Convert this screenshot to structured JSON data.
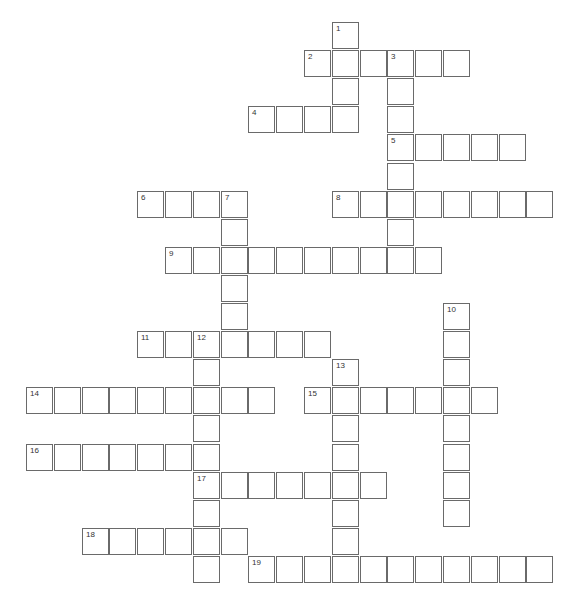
{
  "puzzle": {
    "type": "crossword",
    "grid": {
      "origin_x": 26,
      "origin_y": 22,
      "pitch_x": 27.8,
      "pitch_y": 28.1,
      "cell_size": 25
    },
    "entries": [
      {
        "number": "1",
        "direction": "down",
        "col": 11,
        "row": 0,
        "length": 4
      },
      {
        "number": "2",
        "direction": "across",
        "col": 10,
        "row": 1,
        "length": 6
      },
      {
        "number": "3",
        "direction": "down",
        "col": 13,
        "row": 1,
        "length": 8
      },
      {
        "number": "4",
        "direction": "across",
        "col": 8,
        "row": 3,
        "length": 4
      },
      {
        "number": "5",
        "direction": "across",
        "col": 13,
        "row": 4,
        "length": 5
      },
      {
        "number": "6",
        "direction": "across",
        "col": 4,
        "row": 6,
        "length": 4
      },
      {
        "number": "7",
        "direction": "down",
        "col": 7,
        "row": 6,
        "length": 6
      },
      {
        "number": "8",
        "direction": "across",
        "col": 11,
        "row": 6,
        "length": 8
      },
      {
        "number": "9",
        "direction": "across",
        "col": 5,
        "row": 8,
        "length": 10
      },
      {
        "number": "10",
        "direction": "down",
        "col": 15,
        "row": 10,
        "length": 8
      },
      {
        "number": "11",
        "direction": "across",
        "col": 4,
        "row": 11,
        "length": 7
      },
      {
        "number": "12",
        "direction": "down",
        "col": 6,
        "row": 11,
        "length": 9
      },
      {
        "number": "13",
        "direction": "down",
        "col": 11,
        "row": 12,
        "length": 8
      },
      {
        "number": "14",
        "direction": "across",
        "col": 0,
        "row": 13,
        "length": 9
      },
      {
        "number": "15",
        "direction": "across",
        "col": 10,
        "row": 13,
        "length": 7
      },
      {
        "number": "16",
        "direction": "across",
        "col": 0,
        "row": 15,
        "length": 7
      },
      {
        "number": "17",
        "direction": "across",
        "col": 6,
        "row": 16,
        "length": 7
      },
      {
        "number": "18",
        "direction": "across",
        "col": 2,
        "row": 18,
        "length": 6
      },
      {
        "number": "19",
        "direction": "across",
        "col": 8,
        "row": 19,
        "length": 11
      }
    ]
  }
}
